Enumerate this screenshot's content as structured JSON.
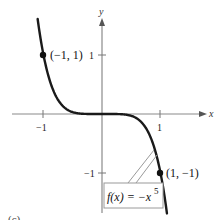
{
  "chart_data": {
    "type": "line",
    "title": "",
    "function": "f(x) = -x^5",
    "xlabel": "x",
    "ylabel": "y",
    "x_ticks": [
      -1,
      1
    ],
    "x_tick_labels": [
      "−1",
      "1"
    ],
    "y_ticks": [
      1,
      -1
    ],
    "y_tick_labels": [
      "1",
      "−1"
    ],
    "xlim": [
      -1.75,
      1.95
    ],
    "ylim": [
      -1.8,
      1.9
    ],
    "grid": false,
    "legend": null,
    "series": [
      {
        "name": "f(x) = −x⁵",
        "x": [
          -1.18,
          -1.1,
          -1.0,
          -0.9,
          -0.8,
          -0.6,
          -0.4,
          0,
          0.4,
          0.6,
          0.8,
          0.9,
          1.0,
          1.1,
          1.18
        ],
        "values": [
          2.29,
          1.61,
          1.0,
          0.59,
          0.33,
          0.08,
          0.01,
          0,
          -0.01,
          -0.08,
          -0.33,
          -0.59,
          -1.0,
          -1.61,
          -2.29
        ]
      }
    ],
    "highlighted_points": [
      {
        "x": -1,
        "y": 1,
        "label": "(−1, 1)"
      },
      {
        "x": 1,
        "y": -1,
        "label": "(1, −1)"
      }
    ],
    "annotations": [
      {
        "text": "f(x) = −x",
        "superscript": "5",
        "type": "boxed-callout",
        "points_to": "curve near x≈0.9"
      }
    ],
    "panel_label": "(c)"
  },
  "labels": {
    "x_axis": "x",
    "y_axis": "y",
    "x_tick_neg": "−1",
    "x_tick_pos": "1",
    "y_tick_pos": "1",
    "y_tick_neg": "−1",
    "point_a": "(−1, 1)",
    "point_b": "(1, −1)",
    "func_main": "f(x) = −x",
    "func_exp": "5",
    "panel": "(c)"
  },
  "colors": {
    "curve": "#1a1a1a",
    "axis": "#8a8a8a",
    "callout_line": "#9a9a9a",
    "point": "#111111",
    "background": "#ffffff"
  }
}
